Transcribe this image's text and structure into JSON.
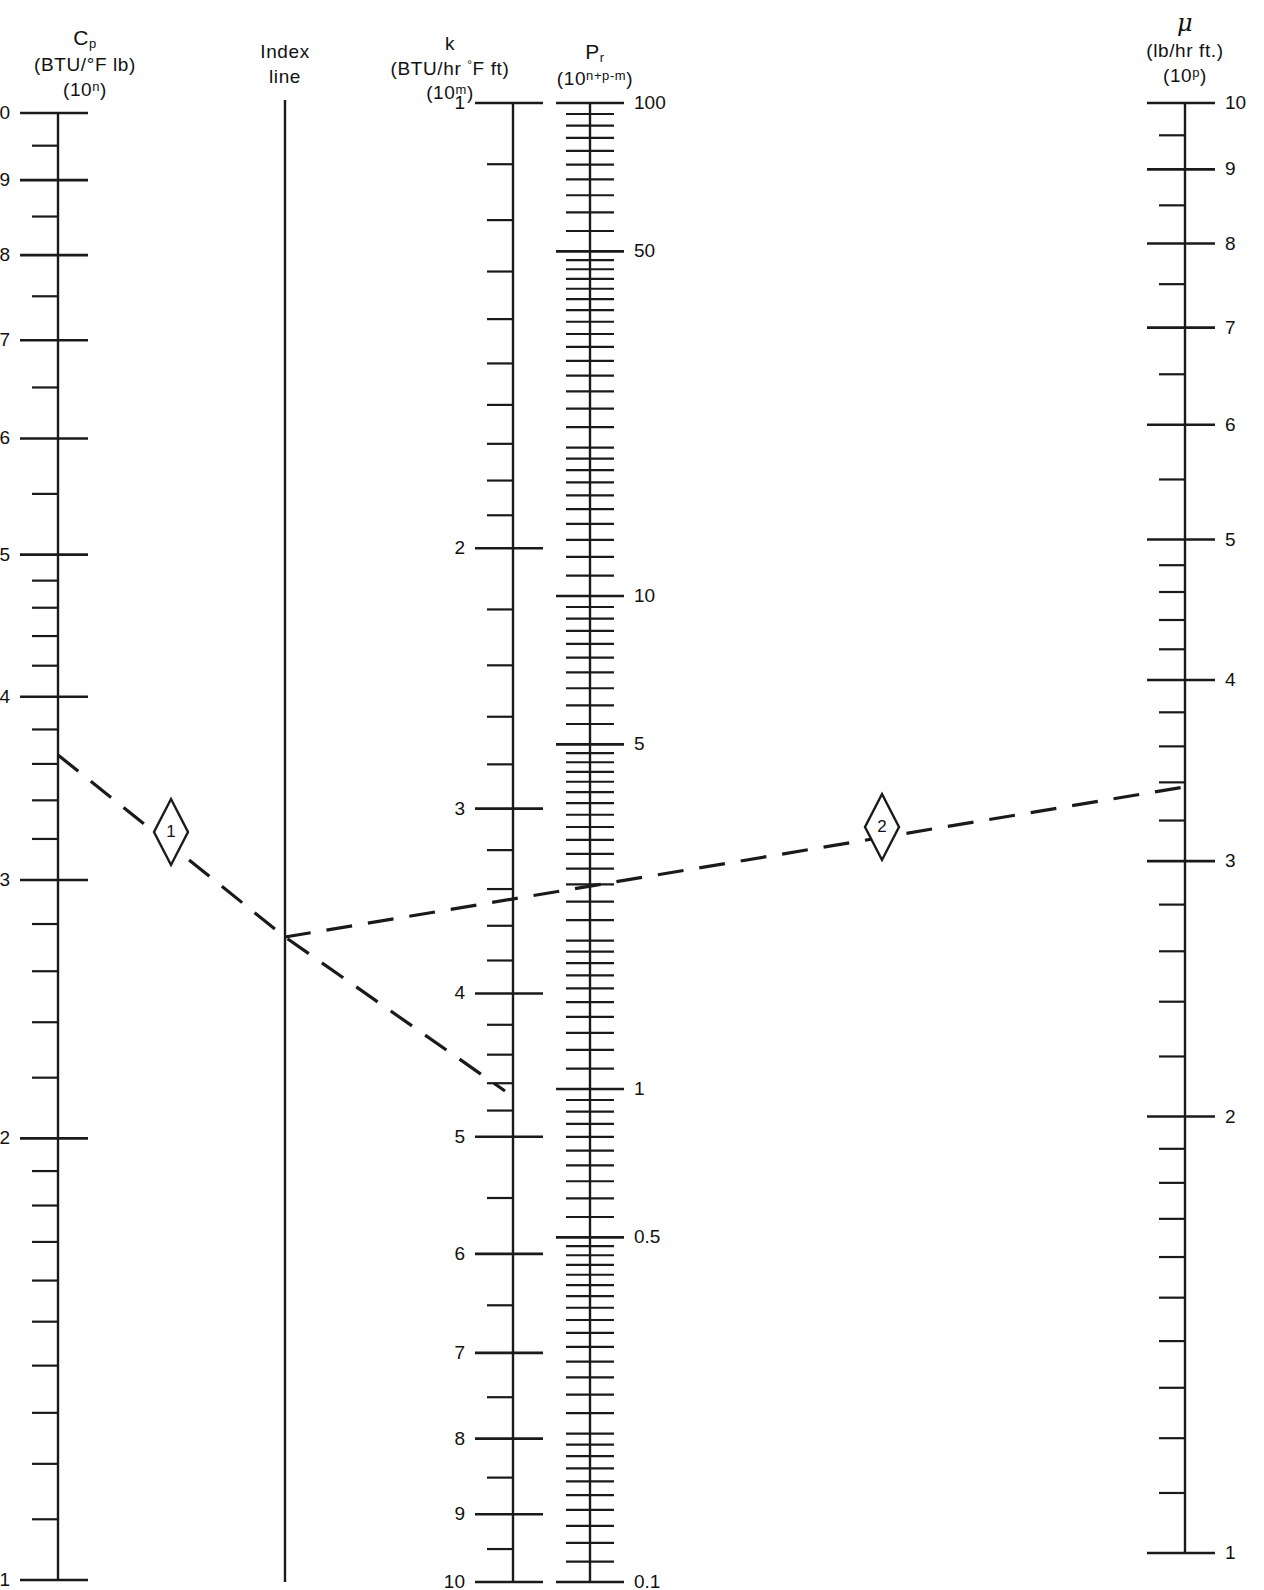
{
  "figure": {
    "kind": "nomogram",
    "background_color": "#ffffff",
    "line_color": "#1a1a1a",
    "width": 1264,
    "height": 1590
  },
  "axes": {
    "cp": {
      "name": "Cp",
      "symbol": "C",
      "subscript": "p",
      "units": "(BTU/°F lb)",
      "power": "(10n)",
      "power_base": "(10",
      "power_exp": "n",
      "power_close": ")",
      "direction": "descending",
      "scale": "log",
      "top_value": "10",
      "bottom_value": "1",
      "major_labels": [
        "10",
        "9",
        "8",
        "7",
        "6",
        "5",
        "4",
        "3",
        "2",
        "1"
      ]
    },
    "index": {
      "name": "Index line",
      "line1": "Index",
      "line2": "line"
    },
    "k": {
      "name": "k",
      "symbol": "k",
      "units": "(BTU/hr °F ft)",
      "power_base": "(10",
      "power_exp": "m",
      "power_close": ")",
      "direction": "ascending",
      "scale": "log",
      "top_value": "1",
      "bottom_value": "10",
      "major_labels": [
        "1",
        "2",
        "3",
        "4",
        "5",
        "6",
        "7",
        "8",
        "9",
        "10"
      ]
    },
    "pr": {
      "name": "Pr",
      "symbol": "P",
      "subscript": "r",
      "power_base": "(10",
      "power_exp": "n+p-m",
      "power_close": ")",
      "direction": "descending",
      "scale": "log",
      "top_value": "100",
      "bottom_value": "0.1",
      "labeled_ticks": [
        "100",
        "50",
        "10",
        "5",
        "1",
        "0.5",
        "0.1"
      ]
    },
    "mu": {
      "name": "mu",
      "symbol": "μ",
      "units": "(lb/hr ft.)",
      "power_base": "(10",
      "power_exp": "p",
      "power_close": ")",
      "direction": "descending",
      "scale": "log",
      "top_value": "10",
      "bottom_value": "1",
      "major_labels": [
        "10",
        "9",
        "8",
        "7",
        "6",
        "5",
        "4",
        "3",
        "2",
        "1"
      ]
    }
  },
  "markers": [
    {
      "label": "1",
      "x": 171,
      "y": 832
    },
    {
      "label": "2",
      "x": 882,
      "y": 827
    }
  ],
  "construction_lines": [
    {
      "id": "line-1",
      "label": "1",
      "style": "dashed",
      "from_axis": "cp",
      "from_value": 3.5,
      "pivot_axis": "index",
      "to_axis": "k",
      "to_value": 4.85,
      "points": [
        [
          58,
          755
        ],
        [
          285,
          937
        ],
        [
          505,
          1091
        ]
      ]
    },
    {
      "id": "line-2",
      "label": "2",
      "style": "dashed",
      "from_axis": "index",
      "through_axis_k": 3.4,
      "through_axis_pr": 2.5,
      "to_axis": "mu",
      "to_value": 3.3,
      "points": [
        [
          285,
          937
        ],
        [
          1190,
          786
        ]
      ]
    }
  ],
  "chart_data": {
    "type": "line",
    "title": "",
    "xlabel": "",
    "ylabel": "",
    "subtitle": "",
    "legend": [],
    "grid": false,
    "scales": [
      {
        "id": "cp",
        "title_lines": [
          "C_p",
          "(BTU/°F lb)",
          "(10^n)"
        ],
        "x": 58,
        "y_top": 113,
        "y_bottom": 1580,
        "log_top": 10,
        "log_bottom": 1,
        "tick_side": "left",
        "label_side": "left",
        "major_ticks": [
          10,
          9,
          8,
          7,
          6,
          5,
          4,
          3,
          2,
          1
        ],
        "minor_step_rules": [
          [
            1,
            2,
            0.1
          ],
          [
            2,
            5,
            0.1
          ],
          [
            5,
            10,
            0.2
          ]
        ]
      },
      {
        "id": "k",
        "title_lines": [
          "k",
          "(BTU/hr °F ft)",
          "(10^m)"
        ],
        "x": 513,
        "y_top": 103,
        "y_bottom": 1582,
        "log_top": 1,
        "log_bottom": 10,
        "tick_side": "left",
        "label_side": "left",
        "major_ticks": [
          1,
          2,
          3,
          4,
          5,
          6,
          7,
          8,
          9,
          10
        ],
        "minor_step_rules": [
          [
            1,
            2,
            0.1
          ],
          [
            2,
            5,
            0.1
          ],
          [
            5,
            10,
            0.2
          ]
        ]
      },
      {
        "id": "pr",
        "title_lines": [
          "P_r",
          "(10^{n+p-m})"
        ],
        "x": 590,
        "y_top": 103,
        "y_bottom": 1582,
        "log_top": 100,
        "log_bottom": 0.1,
        "tick_side": "both",
        "label_side": "right",
        "labeled": [
          100,
          50,
          10,
          5,
          1,
          0.5,
          0.1
        ]
      },
      {
        "id": "mu",
        "title_lines": [
          "μ",
          "(lb/hr ft.)",
          "(10^p)"
        ],
        "x": 1185,
        "y_top": 103,
        "y_bottom": 1553,
        "log_top": 10,
        "log_bottom": 1,
        "tick_side": "left",
        "label_side": "right",
        "major_ticks": [
          10,
          9,
          8,
          7,
          6,
          5,
          4,
          3,
          2,
          1
        ],
        "minor_step_rules": [
          [
            1,
            2,
            0.1
          ],
          [
            2,
            5,
            0.1
          ],
          [
            5,
            10,
            0.2
          ]
        ]
      }
    ],
    "index_line": {
      "x": 285,
      "y_top": 100,
      "y_bottom": 1582
    }
  }
}
